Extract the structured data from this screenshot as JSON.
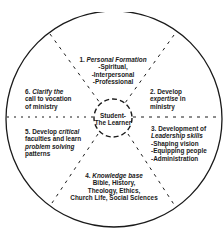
{
  "diagram": {
    "center": {
      "line1": "Student-",
      "line2": "The Learner"
    },
    "segments": [
      {
        "id": 1,
        "number": "1.",
        "title": "Personal Formation",
        "items": [
          "-Spiritual,",
          "-Interpersonal",
          "-Professional"
        ]
      },
      {
        "id": 2,
        "number": "2.",
        "pre": "Develop",
        "title": "expertise",
        "post": "in ministry"
      },
      {
        "id": 3,
        "number": "3.",
        "pre": "Development of",
        "title": "Leadership skills",
        "items": [
          "-Shaping vision",
          "-Equipping people",
          "-Administration"
        ]
      },
      {
        "id": 4,
        "number": "4.",
        "title": "Knowledge base",
        "items": [
          "Bible, History,",
          "Theology, Ethics,",
          "Church Life, Social Sciences"
        ]
      },
      {
        "id": 5,
        "number": "5.",
        "pre": "Develop",
        "title": "critical",
        "line2": "faculties and learn",
        "title2": "problem solving",
        "line4": "patterns"
      },
      {
        "id": 6,
        "number": "6.",
        "title": "Clarify the",
        "line2": "call to vocation",
        "line3": "of ministry"
      }
    ],
    "colors": {
      "stroke": "#1a1a1a",
      "background": "#ffffff"
    }
  }
}
